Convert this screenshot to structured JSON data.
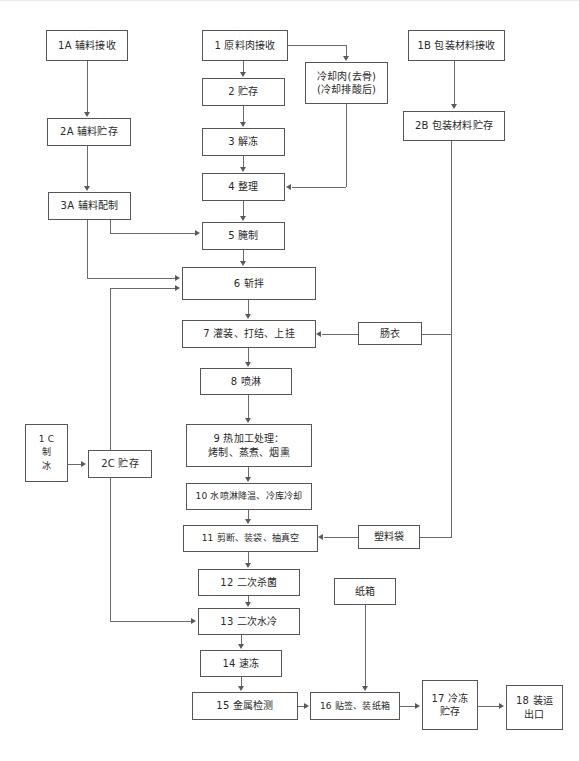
{
  "diagram": {
    "title": "",
    "type": "process-flow-chart",
    "colors": {
      "box_border": "#555555",
      "connector": "#6a6a6a",
      "background": "#ffffff",
      "text": "#2a2a2a"
    },
    "nodes": [
      {
        "id": "n1A",
        "label": "1A 辅料接收",
        "lines": [
          "1A 辅料接收"
        ]
      },
      {
        "id": "n1",
        "label": "1 原料肉接收",
        "lines": [
          "1  原料肉接收"
        ]
      },
      {
        "id": "nCool",
        "label": "冷却肉(去骨)(冷却排酸后)",
        "lines": [
          "冷却肉(去骨)",
          "(冷却排酸后)"
        ]
      },
      {
        "id": "n1B",
        "label": "1B 包装材料接收",
        "lines": [
          "1B 包装材料接收"
        ]
      },
      {
        "id": "n2",
        "label": "2 贮存",
        "lines": [
          "2   贮存"
        ]
      },
      {
        "id": "n2A",
        "label": "2A 辅料贮存",
        "lines": [
          "2A 辅料贮存"
        ]
      },
      {
        "id": "n2B",
        "label": "2B 包装材料贮存",
        "lines": [
          "2B 包装材料贮存"
        ]
      },
      {
        "id": "n3",
        "label": "3 解冻",
        "lines": [
          "3   解冻"
        ]
      },
      {
        "id": "n4",
        "label": "4 整理",
        "lines": [
          "4   整理"
        ]
      },
      {
        "id": "n3A",
        "label": "3A 辅料配制",
        "lines": [
          "3A 辅料配制"
        ]
      },
      {
        "id": "n5",
        "label": "5 腌制",
        "lines": [
          "5   腌制"
        ]
      },
      {
        "id": "n6",
        "label": "6 斩拌",
        "lines": [
          "6   斩拌"
        ]
      },
      {
        "id": "n7",
        "label": "7 灌装、打结、上挂",
        "lines": [
          "7  灌装、打结、上挂"
        ]
      },
      {
        "id": "nCasing",
        "label": "肠衣",
        "lines": [
          "肠衣"
        ]
      },
      {
        "id": "n8",
        "label": "8 喷淋",
        "lines": [
          "8  喷淋"
        ]
      },
      {
        "id": "n9",
        "label": "9 热加工处理：烤制、蒸煮、烟熏",
        "lines": [
          "9   热加工处理：",
          "烤制、蒸煮、烟熏"
        ]
      },
      {
        "id": "n1C",
        "label": "1C 制冰",
        "lines": [
          "1 C",
          "制",
          "冰"
        ]
      },
      {
        "id": "n2C",
        "label": "2C 贮存",
        "lines": [
          "2C 贮存"
        ]
      },
      {
        "id": "n10",
        "label": "10 水喷淋降温、冷库冷却",
        "lines": [
          "10  水喷淋降温、冷库冷却"
        ]
      },
      {
        "id": "n11",
        "label": "11 剪断、装袋、抽真空",
        "lines": [
          "11  剪断、装袋、抽真空"
        ]
      },
      {
        "id": "nBag",
        "label": "塑料袋",
        "lines": [
          "塑料袋"
        ]
      },
      {
        "id": "n12",
        "label": "12 二次杀菌",
        "lines": [
          "12  二次杀菌"
        ]
      },
      {
        "id": "n13",
        "label": "13 二次水冷",
        "lines": [
          "13  二次水冷"
        ]
      },
      {
        "id": "nCarton",
        "label": "纸箱",
        "lines": [
          "纸箱"
        ]
      },
      {
        "id": "n14",
        "label": "14 速冻",
        "lines": [
          "14  速冻"
        ]
      },
      {
        "id": "n15",
        "label": "15 金属检测",
        "lines": [
          "15  金属检测"
        ]
      },
      {
        "id": "n16",
        "label": "16 贴签、装纸箱",
        "lines": [
          "16 贴签、装纸箱"
        ]
      },
      {
        "id": "n17",
        "label": "17 冷冻贮存",
        "lines": [
          "17 冷冻",
          "贮存"
        ]
      },
      {
        "id": "n18",
        "label": "18 装运出口",
        "lines": [
          "18  装运",
          "出口"
        ]
      }
    ]
  }
}
